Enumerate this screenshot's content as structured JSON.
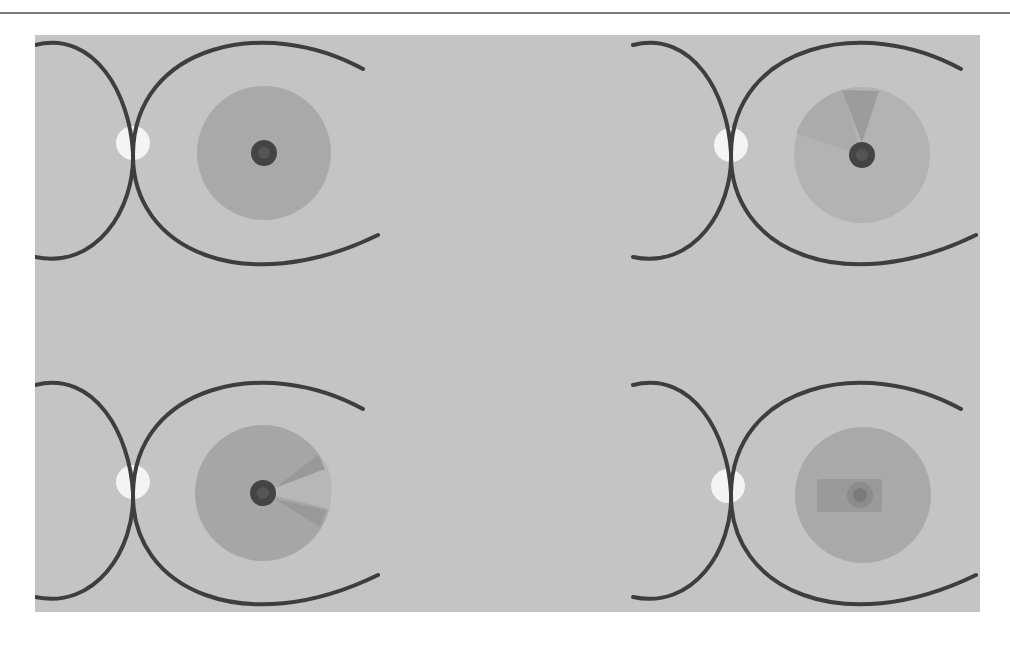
{
  "figure": {
    "colors": {
      "page_background": "#ffffff",
      "top_rule": "#7a7a7a",
      "panel_background": "#c4c4c4",
      "arc_stroke": "#3e3e3e",
      "white_dot": "#f4f4f4",
      "disc": "#a9a9a9",
      "disc_light": "#b9b9b9",
      "wedge_dark": "#999999",
      "pupil_outer": "#444444",
      "pupil_inner": "#5a5a5a",
      "rect": "#9a9a9a"
    },
    "panels": [
      {
        "id": "top-left",
        "variant": "plain",
        "origin": [
          0,
          0
        ]
      },
      {
        "id": "top-right",
        "variant": "top-wedge",
        "origin": [
          598,
          0
        ]
      },
      {
        "id": "bottom-left",
        "variant": "right-wedges",
        "origin": [
          0,
          340
        ]
      },
      {
        "id": "bottom-right",
        "variant": "rectangle-pupil",
        "origin": [
          598,
          340
        ]
      }
    ]
  }
}
